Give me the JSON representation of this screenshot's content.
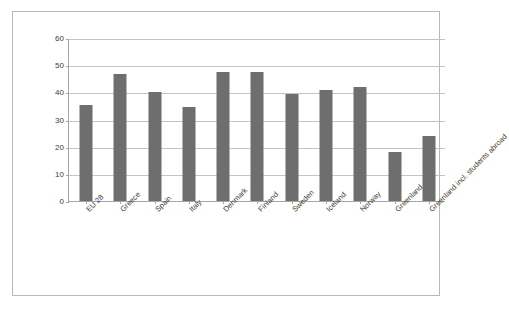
{
  "chart_data": {
    "type": "bar",
    "title": "",
    "subtitle": "",
    "xlabel": "",
    "ylabel": "",
    "ylim": [
      0,
      60
    ],
    "yticks": [
      0,
      10,
      20,
      30,
      40,
      50,
      60
    ],
    "ytick_labels": [
      "0",
      "10",
      "20",
      "30",
      "40",
      "50",
      "60"
    ],
    "grid": true,
    "legend": false,
    "legend_position": "none",
    "bar_color": "#6e6e6e",
    "categories": [
      "EU 28",
      "Greece",
      "Spain",
      "Italy",
      "Denmark",
      "Finland",
      "Sweden",
      "Iceland",
      "Norway",
      "Greenland",
      "Greenland incl. students abroad"
    ],
    "values": [
      35.4,
      46.8,
      40.3,
      34.7,
      47.6,
      47.4,
      39.5,
      41.0,
      41.9,
      17.9,
      24.0
    ]
  },
  "colors": {
    "bar": "#6e6e6e",
    "gridline": "#c4c4c4",
    "axis": "#a6a6a6",
    "frame": "#b8b8b8",
    "text": "#3d3d3d",
    "background": "#ffffff"
  }
}
